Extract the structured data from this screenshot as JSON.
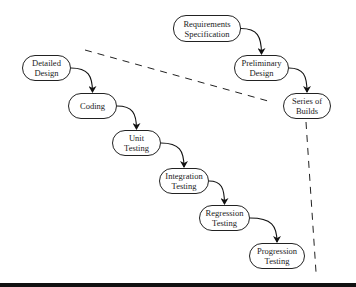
{
  "diagram": {
    "nodes": [
      {
        "id": "req",
        "line1": "Requirements",
        "line2": "Specification",
        "x": 173,
        "y": 15,
        "w": 68,
        "h": 27
      },
      {
        "id": "prelim",
        "line1": "Preliminary",
        "line2": "Design",
        "x": 234,
        "y": 55,
        "w": 55,
        "h": 26
      },
      {
        "id": "builds",
        "line1": "Series of",
        "line2": "Builds",
        "x": 283,
        "y": 93,
        "w": 48,
        "h": 26
      },
      {
        "id": "detailed",
        "line1": "Detailed",
        "line2": "Design",
        "x": 22,
        "y": 55,
        "w": 49,
        "h": 26
      },
      {
        "id": "coding",
        "line1": "Coding",
        "line2": "",
        "x": 68,
        "y": 93,
        "w": 49,
        "h": 26
      },
      {
        "id": "unit",
        "line1": "Unit",
        "line2": "Testing",
        "x": 112,
        "y": 130,
        "w": 49,
        "h": 26
      },
      {
        "id": "integration",
        "line1": "Integration",
        "line2": "Testing",
        "x": 159,
        "y": 168,
        "w": 50,
        "h": 26
      },
      {
        "id": "regression",
        "line1": "Regression",
        "line2": "Testing",
        "x": 199,
        "y": 205,
        "w": 51,
        "h": 26
      },
      {
        "id": "progression",
        "line1": "Progression",
        "line2": "Testing",
        "x": 249,
        "y": 243,
        "w": 56,
        "h": 26
      }
    ],
    "edges": [
      {
        "from": "req",
        "to": "prelim"
      },
      {
        "from": "prelim",
        "to": "builds"
      },
      {
        "from": "detailed",
        "to": "coding"
      },
      {
        "from": "coding",
        "to": "unit"
      },
      {
        "from": "unit",
        "to": "integration"
      },
      {
        "from": "integration",
        "to": "regression"
      },
      {
        "from": "regression",
        "to": "progression"
      }
    ],
    "dashed_lines": [
      {
        "x1": 85,
        "y1": 50,
        "x2": 268,
        "y2": 101
      },
      {
        "x1": 306,
        "y1": 122,
        "x2": 316,
        "y2": 272
      }
    ]
  }
}
